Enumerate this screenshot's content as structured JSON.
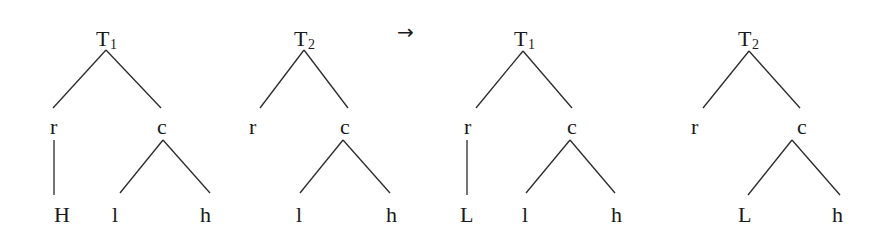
{
  "arrow": "→",
  "trees": [
    {
      "id": "before-T1",
      "root": {
        "label": "T",
        "sub": "1"
      },
      "children": [
        {
          "label": "r",
          "children": [
            {
              "label": "H"
            }
          ]
        },
        {
          "label": "c",
          "children": [
            {
              "label": "l"
            },
            {
              "label": "h"
            }
          ]
        }
      ]
    },
    {
      "id": "before-T2",
      "root": {
        "label": "T",
        "sub": "2"
      },
      "children": [
        {
          "label": "r",
          "children": []
        },
        {
          "label": "c",
          "children": [
            {
              "label": "l"
            },
            {
              "label": "h"
            }
          ]
        }
      ]
    },
    {
      "id": "after-T1",
      "root": {
        "label": "T",
        "sub": "1"
      },
      "children": [
        {
          "label": "r",
          "children": [
            {
              "label": "L"
            }
          ]
        },
        {
          "label": "c",
          "children": [
            {
              "label": "l"
            },
            {
              "label": "h"
            }
          ]
        }
      ]
    },
    {
      "id": "after-T2",
      "root": {
        "label": "T",
        "sub": "2"
      },
      "children": [
        {
          "label": "r",
          "children": []
        },
        {
          "label": "c",
          "children": [
            {
              "label": "L"
            },
            {
              "label": "h"
            }
          ]
        }
      ]
    }
  ]
}
